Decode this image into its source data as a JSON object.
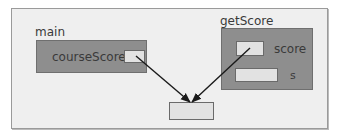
{
  "diagram": {
    "frames": {
      "main": {
        "label": "main",
        "variable": "courseScore"
      },
      "getScore": {
        "label": "getScore",
        "variables": [
          "score",
          "s"
        ]
      }
    },
    "arrows": [
      {
        "from": "courseScore",
        "to": "shared-value"
      },
      {
        "from": "score",
        "to": "shared-value"
      }
    ],
    "colors": {
      "background": "#efefef",
      "frame_fill": "#8e8e8e",
      "cell_fill": "#e2e2e2",
      "arrow": "#1a1a1a"
    }
  }
}
